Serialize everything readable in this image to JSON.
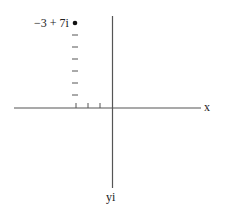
{
  "diagram": {
    "title": "",
    "point": {
      "label": "−3 + 7i",
      "real": -3,
      "imag": 7
    },
    "axes": {
      "x_label": "x",
      "y_label": "yi"
    },
    "ticks": {
      "x_negative_count": 3,
      "y_positive_count": 7
    },
    "colors": {
      "axis": "#555555",
      "point": "#111111",
      "text": "#222222"
    }
  }
}
